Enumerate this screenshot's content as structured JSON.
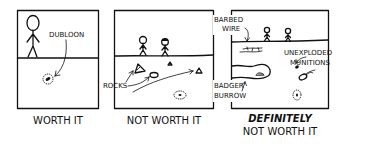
{
  "panels": [
    {
      "labels": {
        "dubloon": "DUBLOON"
      },
      "caption": "WORTH IT"
    },
    {
      "labels": {
        "rocks": "ROCKS"
      },
      "caption": "NOT WORTH IT"
    },
    {
      "labels": {
        "barbed_1": "BARBED",
        "barbed_2": "WIRE",
        "munitions_1": "UNEXPLODED",
        "munitions_2": "MUNITIONS",
        "badger_1": "BADGER",
        "badger_2": "BURROW"
      },
      "caption_line1": "DEFINITELY",
      "caption_line2": "NOT WORTH IT"
    }
  ],
  "colors": {
    "ink": "#111111",
    "background": "#ffffff"
  }
}
